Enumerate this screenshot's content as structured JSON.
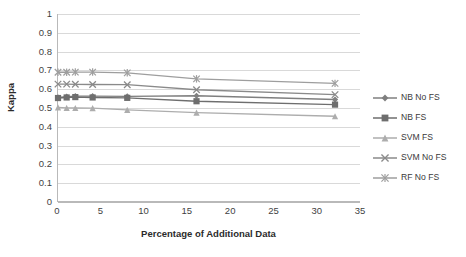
{
  "chart_data": {
    "type": "line",
    "title": "",
    "subtitle": "",
    "xlabel": "Percentage of Additional Data",
    "ylabel": "Kappa",
    "xlim": [
      0,
      35
    ],
    "ylim": [
      0,
      1
    ],
    "xticks": [
      "0",
      "5",
      "10",
      "15",
      "20",
      "25",
      "30",
      "35"
    ],
    "xtick_values": [
      0,
      5,
      10,
      15,
      20,
      25,
      30,
      35
    ],
    "yticks": [
      "0",
      "0.1",
      "0.2",
      "0.3",
      "0.4",
      "0.5",
      "0.6",
      "0.7",
      "0.8",
      "0.9",
      "1"
    ],
    "ytick_values": [
      0,
      0.1,
      0.2,
      0.3,
      0.4,
      0.5,
      0.6,
      0.7,
      0.8,
      0.9,
      1
    ],
    "grid": "horizontal",
    "legend_position": "right",
    "x": [
      0,
      1,
      2,
      4,
      8,
      16,
      32
    ],
    "series": [
      {
        "name": "NB No FS",
        "marker": "diamond",
        "color": "#7f7f7f",
        "values": [
          0.556,
          0.56,
          0.563,
          0.563,
          0.562,
          0.565,
          0.545
        ]
      },
      {
        "name": "NB FS",
        "marker": "square",
        "color": "#6e6e6e",
        "values": [
          0.553,
          0.556,
          0.558,
          0.556,
          0.554,
          0.536,
          0.518
        ]
      },
      {
        "name": "SVM FS",
        "marker": "triangle",
        "color": "#adadad",
        "values": [
          0.503,
          0.501,
          0.5,
          0.499,
          0.49,
          0.475,
          0.456
        ]
      },
      {
        "name": "SVM No FS",
        "marker": "x",
        "color": "#8a8a8a",
        "values": [
          0.627,
          0.627,
          0.626,
          0.625,
          0.624,
          0.597,
          0.571
        ]
      },
      {
        "name": "RF No FS",
        "marker": "star",
        "color": "#9e9e9e",
        "values": [
          0.69,
          0.69,
          0.691,
          0.691,
          0.687,
          0.655,
          0.631
        ]
      }
    ]
  },
  "axes": {
    "x_title": "Percentage of Additional Data",
    "y_title": "Kappa"
  },
  "legend": {
    "items": [
      {
        "label": "NB No FS"
      },
      {
        "label": "NB FS"
      },
      {
        "label": "SVM FS"
      },
      {
        "label": "SVM No FS"
      },
      {
        "label": "RF No FS"
      }
    ]
  }
}
